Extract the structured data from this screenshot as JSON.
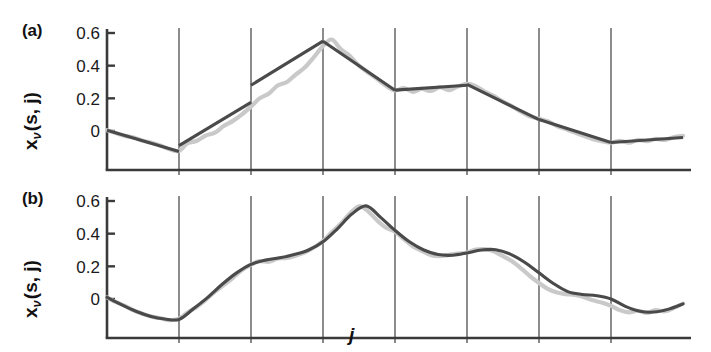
{
  "figure": {
    "width": 711,
    "height": 352,
    "background": "#ffffff",
    "fit_color": "#4a4a4a",
    "raw_color": "#c9c9c9",
    "axis_color": "#3a3a3a",
    "grid_color": "#2e2e2e"
  },
  "axes": {
    "xlabel": "j",
    "ylabel_base": "x",
    "ylabel_sub": "ν",
    "ylabel_rest": "(s, j)",
    "ytick_labels": [
      "0.6",
      "0.4",
      "0.2",
      "0"
    ],
    "ytick_values": [
      0.6,
      0.4,
      0.2,
      0
    ],
    "ylim": [
      -0.17,
      0.65
    ],
    "xlim": [
      0,
      8
    ],
    "n_gridlines": 7,
    "gridline_x_values": [
      1,
      2,
      3,
      4,
      5,
      6,
      7
    ],
    "grid": "vertical-only"
  },
  "panels": [
    {
      "tag": "(a)",
      "name": "piecewise-linear-fit"
    },
    {
      "tag": "(b)",
      "name": "smooth-spline-fit"
    }
  ],
  "chart_data": [
    {
      "type": "line",
      "title": "(a)",
      "xlabel": "j",
      "ylabel": "x_ν(s, j)",
      "ylim": [
        -0.17,
        0.65
      ],
      "xlim": [
        0,
        8
      ],
      "ytick_labels": [
        "0",
        "0.2",
        "0.4",
        "0.6"
      ],
      "grid": "vertical",
      "description": "Piecewise-linear fit with discontinuous jumps at segment boundaries",
      "series": [
        {
          "name": "piecewise-linear-fit",
          "color": "#4a4a4a",
          "segments": [
            {
              "x": [
                0.0,
                1.0
              ],
              "y": [
                0.005,
                -0.125
              ]
            },
            {
              "x": [
                1.0,
                2.0
              ],
              "y": [
                -0.09,
                0.175
              ]
            },
            {
              "x": [
                2.0,
                3.0
              ],
              "y": [
                0.28,
                0.55
              ]
            },
            {
              "x": [
                3.0,
                4.0
              ],
              "y": [
                0.55,
                0.25
              ]
            },
            {
              "x": [
                4.0,
                5.0
              ],
              "y": [
                0.25,
                0.28
              ]
            },
            {
              "x": [
                5.0,
                6.0
              ],
              "y": [
                0.285,
                0.07
              ]
            },
            {
              "x": [
                6.0,
                7.0
              ],
              "y": [
                0.07,
                -0.07
              ]
            },
            {
              "x": [
                7.0,
                8.0
              ],
              "y": [
                -0.07,
                -0.04
              ]
            }
          ]
        },
        {
          "name": "raw-noisy-data",
          "color": "#c9c9c9",
          "x": [
            0.0,
            0.12,
            0.25,
            0.37,
            0.5,
            0.62,
            0.75,
            0.87,
            1.0,
            1.12,
            1.25,
            1.37,
            1.5,
            1.62,
            1.75,
            1.87,
            2.0,
            2.12,
            2.25,
            2.37,
            2.5,
            2.62,
            2.75,
            2.87,
            3.0,
            3.12,
            3.25,
            3.37,
            3.5,
            3.62,
            3.75,
            3.87,
            4.0,
            4.12,
            4.25,
            4.37,
            4.5,
            4.62,
            4.75,
            4.87,
            5.0,
            5.12,
            5.25,
            5.37,
            5.5,
            5.62,
            5.75,
            5.87,
            6.0,
            6.12,
            6.25,
            6.37,
            6.5,
            6.62,
            6.75,
            6.87,
            7.0,
            7.12,
            7.25,
            7.37,
            7.5,
            7.62,
            7.75,
            7.87,
            8.0
          ],
          "y": [
            0.005,
            -0.012,
            -0.03,
            -0.04,
            -0.06,
            -0.072,
            -0.09,
            -0.112,
            -0.122,
            -0.075,
            -0.06,
            -0.028,
            -0.01,
            0.03,
            0.062,
            0.1,
            0.15,
            0.2,
            0.23,
            0.278,
            0.3,
            0.345,
            0.39,
            0.45,
            0.52,
            0.56,
            0.5,
            0.46,
            0.4,
            0.36,
            0.32,
            0.278,
            0.248,
            0.262,
            0.24,
            0.258,
            0.245,
            0.268,
            0.25,
            0.272,
            0.288,
            0.275,
            0.24,
            0.215,
            0.18,
            0.152,
            0.118,
            0.09,
            0.075,
            0.06,
            0.03,
            0.012,
            -0.01,
            -0.03,
            -0.05,
            -0.062,
            -0.072,
            -0.06,
            -0.072,
            -0.055,
            -0.062,
            -0.048,
            -0.055,
            -0.038,
            -0.03
          ]
        }
      ]
    },
    {
      "type": "line",
      "title": "(b)",
      "xlabel": "j",
      "ylabel": "x_ν(s, j)",
      "ylim": [
        -0.17,
        0.65
      ],
      "xlim": [
        0,
        8
      ],
      "ytick_labels": [
        "0",
        "0.2",
        "0.4",
        "0.6"
      ],
      "grid": "vertical",
      "description": "Smooth continuous spline fit, no discontinuities at segment boundaries",
      "series": [
        {
          "name": "smooth-spline-fit",
          "color": "#4a4a4a",
          "x": [
            0.0,
            0.2,
            0.4,
            0.6,
            0.8,
            1.0,
            1.2,
            1.4,
            1.6,
            1.8,
            2.0,
            2.2,
            2.4,
            2.6,
            2.8,
            3.0,
            3.2,
            3.4,
            3.6,
            3.8,
            4.0,
            4.2,
            4.4,
            4.6,
            4.8,
            5.0,
            5.2,
            5.4,
            5.6,
            5.8,
            6.0,
            6.2,
            6.4,
            6.6,
            6.8,
            7.0,
            7.2,
            7.4,
            7.6,
            7.8,
            8.0
          ],
          "y": [
            0.01,
            -0.035,
            -0.075,
            -0.105,
            -0.122,
            -0.125,
            -0.06,
            0.01,
            0.09,
            0.16,
            0.212,
            0.238,
            0.252,
            0.272,
            0.3,
            0.35,
            0.43,
            0.52,
            0.57,
            0.5,
            0.42,
            0.35,
            0.3,
            0.272,
            0.268,
            0.282,
            0.3,
            0.302,
            0.275,
            0.225,
            0.16,
            0.095,
            0.045,
            0.028,
            0.02,
            0.0,
            -0.045,
            -0.075,
            -0.08,
            -0.062,
            -0.03
          ]
        },
        {
          "name": "raw-noisy-data",
          "color": "#c9c9c9",
          "x": [
            0.0,
            0.12,
            0.25,
            0.37,
            0.5,
            0.62,
            0.75,
            0.87,
            1.0,
            1.12,
            1.25,
            1.37,
            1.5,
            1.62,
            1.75,
            1.87,
            2.0,
            2.12,
            2.25,
            2.37,
            2.5,
            2.62,
            2.75,
            2.87,
            3.0,
            3.12,
            3.25,
            3.37,
            3.5,
            3.62,
            3.75,
            3.87,
            4.0,
            4.12,
            4.25,
            4.37,
            4.5,
            4.62,
            4.75,
            4.87,
            5.0,
            5.12,
            5.25,
            5.37,
            5.5,
            5.62,
            5.75,
            5.87,
            6.0,
            6.12,
            6.25,
            6.37,
            6.5,
            6.62,
            6.75,
            6.87,
            7.0,
            7.12,
            7.25,
            7.37,
            7.5,
            7.62,
            7.75,
            7.87,
            8.0
          ],
          "y": [
            0.01,
            -0.018,
            -0.042,
            -0.07,
            -0.092,
            -0.108,
            -0.118,
            -0.13,
            -0.12,
            -0.082,
            -0.048,
            -0.005,
            0.045,
            0.085,
            0.13,
            0.175,
            0.21,
            0.232,
            0.228,
            0.248,
            0.252,
            0.265,
            0.285,
            0.315,
            0.355,
            0.408,
            0.462,
            0.522,
            0.568,
            0.54,
            0.482,
            0.438,
            0.412,
            0.368,
            0.322,
            0.295,
            0.268,
            0.262,
            0.27,
            0.278,
            0.285,
            0.302,
            0.305,
            0.292,
            0.262,
            0.232,
            0.188,
            0.142,
            0.098,
            0.062,
            0.04,
            0.03,
            0.025,
            0.012,
            -0.008,
            -0.022,
            -0.042,
            -0.068,
            -0.082,
            -0.072,
            -0.085,
            -0.068,
            -0.075,
            -0.055,
            -0.028
          ]
        }
      ]
    }
  ]
}
